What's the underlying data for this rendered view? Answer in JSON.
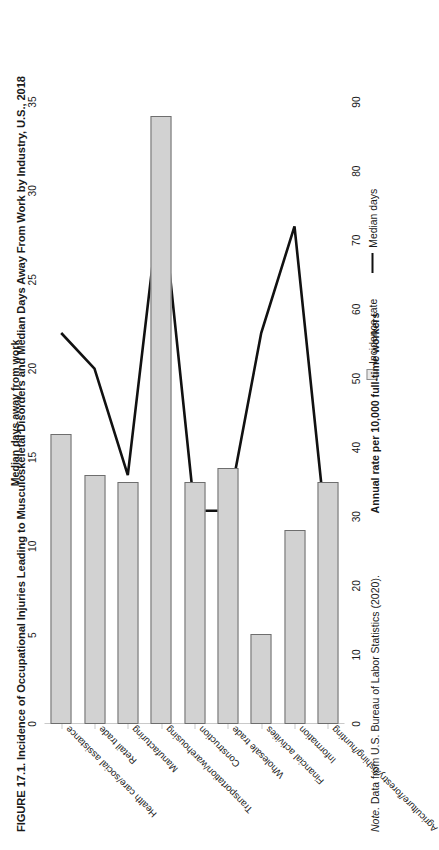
{
  "figure": {
    "title": "FIGURE 17.1. Incidence of Occupational Injuries Leading to Musculoskeletal Disorders and Median Days Away From Work by Industry, U.S., 2018",
    "note_prefix": "Note.",
    "note_text": " Data from U.S. Bureau of Labor Statistics (2020)."
  },
  "legend": {
    "items": [
      {
        "label": "Incidence rate",
        "marker": "square-swatch",
        "color": "#d2d2d2"
      },
      {
        "label": "Median days",
        "marker": "line-swatch",
        "color": "#111111"
      }
    ]
  },
  "chart_data": {
    "type": "bar",
    "title": "FIGURE 17.1. Incidence of Occupational Injuries Leading to Musculoskeletal Disorders and Median Days Away From Work by Industry, U.S., 2018",
    "xlabel": "",
    "categories": [
      "Health care/social assistance",
      "Retail trade",
      "Manufacturing",
      "Transportation/warehousing",
      "Construction",
      "Wholesale trade",
      "Financial activities",
      "Information",
      "Agriculture/forestry/fishing/hunting"
    ],
    "series": [
      {
        "name": "Incidence rate",
        "type": "bar",
        "axis": "primary",
        "ylabel": "Annual rate per 10,000 full-time workers",
        "ylim": [
          0,
          90
        ],
        "ticks": [
          0,
          10,
          20,
          30,
          40,
          50,
          60,
          70,
          80,
          90
        ],
        "values": [
          42,
          36,
          35,
          88,
          35,
          37,
          13,
          28,
          35
        ],
        "color": "#d2d2d2"
      },
      {
        "name": "Median days",
        "type": "line",
        "axis": "secondary",
        "ylabel": "Median days away from work",
        "ylim": [
          0,
          35
        ],
        "ticks": [
          0,
          5,
          10,
          15,
          20,
          25,
          30,
          35
        ],
        "values": [
          22,
          20,
          14,
          30,
          12,
          12,
          22,
          28,
          10
        ],
        "color": "#111111"
      }
    ],
    "grid": false,
    "legend_position": "right"
  }
}
